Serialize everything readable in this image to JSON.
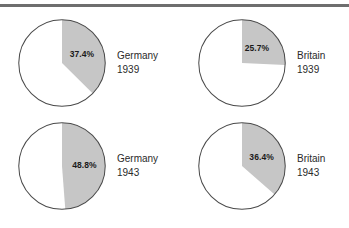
{
  "figure": {
    "background_color": "#ffffff",
    "rule_color": "#6e6e6e",
    "wedge_color": "#c6c6c6",
    "outline_color": "#4a4a4a",
    "text_color": "#2a2a2a"
  },
  "chart_data": {
    "type": "pie",
    "title": "",
    "subtitle": "",
    "xlabel": "",
    "ylabel": "",
    "grid": false,
    "legend_position": "right-of-each-pie",
    "start_angle_deg": 0,
    "direction": "clockwise",
    "slice_colors": [
      "#c6c6c6",
      "#ffffff"
    ],
    "panels": [
      {
        "country": "Germany",
        "year": "1939",
        "label_line1": "Germany",
        "label_line2": "1939",
        "value_label": "37.4%",
        "value": 37.4,
        "remainder": 62.6,
        "slices": [
          {
            "name": "shaded",
            "value": 37.4
          },
          {
            "name": "unshaded",
            "value": 62.6
          }
        ]
      },
      {
        "country": "Britain",
        "year": "1939",
        "label_line1": "Britain",
        "label_line2": "1939",
        "value_label": "25.7%",
        "value": 25.7,
        "remainder": 74.3,
        "slices": [
          {
            "name": "shaded",
            "value": 25.7
          },
          {
            "name": "unshaded",
            "value": 74.3
          }
        ]
      },
      {
        "country": "Germany",
        "year": "1943",
        "label_line1": "Germany",
        "label_line2": "1943",
        "value_label": "48.8%",
        "value": 48.8,
        "remainder": 51.2,
        "slices": [
          {
            "name": "shaded",
            "value": 48.8
          },
          {
            "name": "unshaded",
            "value": 51.2
          }
        ]
      },
      {
        "country": "Britain",
        "year": "1943",
        "label_line1": "Britain",
        "label_line2": "1943",
        "value_label": "36.4%",
        "value": 36.4,
        "remainder": 63.6,
        "slices": [
          {
            "name": "shaded",
            "value": 36.4
          },
          {
            "name": "unshaded",
            "value": 63.6
          }
        ]
      }
    ]
  }
}
